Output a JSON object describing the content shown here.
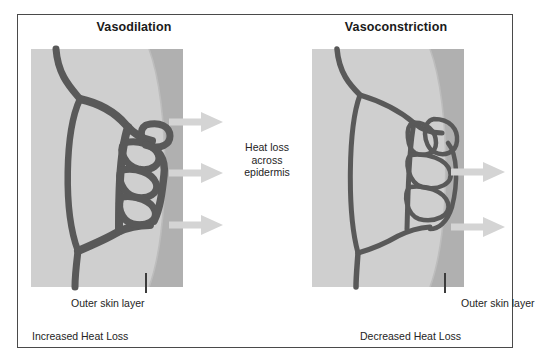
{
  "figure": {
    "type": "anatomical-comparison-diagram",
    "background_color": "#ffffff",
    "border_color": "#4a4a4a"
  },
  "colors": {
    "tissue": "#cfcfcf",
    "skin_layer": "#b0b0b0",
    "vessel": "#595959",
    "vessel_dark": "#4d4d4d",
    "arrow": "#d4d4d4",
    "text": "#242424",
    "title": "#1a1a1a"
  },
  "panels": [
    {
      "id": "vasodilation",
      "title": "Vasodilation",
      "skin_label": "Outer skin layer",
      "caption": "Increased Heat Loss",
      "arrow_count": 3,
      "vessel_state": "dilated",
      "arrow_positions_y": [
        107,
        158,
        210
      ]
    },
    {
      "id": "vasoconstriction",
      "title": "Vasoconstriction",
      "skin_label": "Outer skin layer",
      "caption": "Decreased Heat Loss",
      "arrow_count": 2,
      "vessel_state": "constricted",
      "arrow_positions_y": [
        157,
        212
      ]
    }
  ],
  "center_annotation": {
    "lines": [
      "Heat loss",
      "across",
      "epidermis"
    ]
  }
}
